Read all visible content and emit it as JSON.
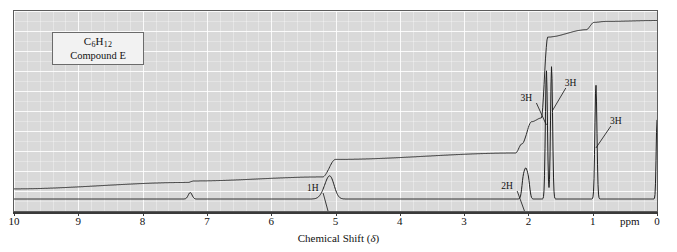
{
  "label_box": {
    "formula_prefix": "C",
    "formula_sub1": "6",
    "formula_mid": "H",
    "formula_sub2": "12",
    "compound_name": "Compound E"
  },
  "axis": {
    "title_text": "Chemical Shift (",
    "title_symbol": "δ",
    "title_close": ")",
    "unit_label": "ppm",
    "tick_labels": [
      "10",
      "9",
      "8",
      "7",
      "6",
      "5",
      "4",
      "3",
      "2",
      "1",
      "0"
    ]
  },
  "annotations": [
    {
      "label": "1H",
      "x_ppm": 5.1
    },
    {
      "label": "2H",
      "x_ppm": 2.05
    },
    {
      "label": "3H",
      "x_ppm": 1.72
    },
    {
      "label": "3H",
      "x_ppm": 1.62
    },
    {
      "label": "3H",
      "x_ppm": 0.95
    }
  ],
  "chart_data": {
    "type": "line",
    "title": "",
    "xlabel": "Chemical Shift (δ)",
    "ylabel": "",
    "xlim": [
      10,
      0
    ],
    "ylim": [
      0,
      1
    ],
    "grid": true,
    "legend": "none",
    "x_unit": "ppm",
    "tick_values": [
      10,
      9,
      8,
      7,
      6,
      5,
      4,
      3,
      2,
      1,
      0
    ],
    "series": [
      {
        "name": "spectrum",
        "kind": "nmr-peaks",
        "peaks": [
          {
            "ppm": 7.26,
            "height": 0.035,
            "width": 0.03,
            "assignment": "residual CHCl3"
          },
          {
            "ppm": 5.12,
            "height": 0.075,
            "width": 0.075,
            "assignment": "1H vinyl multiplet"
          },
          {
            "ppm": 5.07,
            "height": 0.06,
            "width": 0.06,
            "assignment": "1H vinyl multiplet"
          },
          {
            "ppm": 2.08,
            "height": 0.105,
            "width": 0.022,
            "assignment": "2H allylic"
          },
          {
            "ppm": 2.04,
            "height": 0.13,
            "width": 0.022,
            "assignment": "2H allylic"
          },
          {
            "ppm": 2.0,
            "height": 0.098,
            "width": 0.022,
            "assignment": "2H allylic"
          },
          {
            "ppm": 1.72,
            "height": 0.7,
            "width": 0.016,
            "assignment": "3H methyl"
          },
          {
            "ppm": 1.64,
            "height": 0.72,
            "width": 0.016,
            "assignment": "3H methyl"
          },
          {
            "ppm": 0.95,
            "height": 0.62,
            "width": 0.016,
            "assignment": "3H methyl"
          },
          {
            "ppm": 0.0,
            "height": 0.43,
            "width": 0.013,
            "assignment": "TMS reference"
          }
        ]
      },
      {
        "name": "integral",
        "kind": "integration-trace",
        "steps": [
          {
            "ppm": 10.0,
            "level": 0.055
          },
          {
            "ppm": 7.3,
            "level": 0.09
          },
          {
            "ppm": 7.2,
            "level": 0.098
          },
          {
            "ppm": 5.2,
            "level": 0.12
          },
          {
            "ppm": 5.0,
            "level": 0.215
          },
          {
            "ppm": 2.2,
            "level": 0.25
          },
          {
            "ppm": 2.1,
            "level": 0.3
          },
          {
            "ppm": 1.95,
            "level": 0.42
          },
          {
            "ppm": 1.8,
            "level": 0.44
          },
          {
            "ppm": 1.7,
            "level": 0.88
          },
          {
            "ppm": 1.1,
            "level": 0.92
          },
          {
            "ppm": 0.98,
            "level": 0.96
          },
          {
            "ppm": 0.8,
            "level": 0.965
          },
          {
            "ppm": 0.0,
            "level": 0.97
          }
        ]
      }
    ]
  },
  "colors": {
    "plot_background": "#d9d9d9",
    "frame": "#5c5c5c",
    "trace": "#262626",
    "gridline_major": "#ffffff",
    "text": "#111111",
    "label_box_background": "#f2f2f2"
  }
}
